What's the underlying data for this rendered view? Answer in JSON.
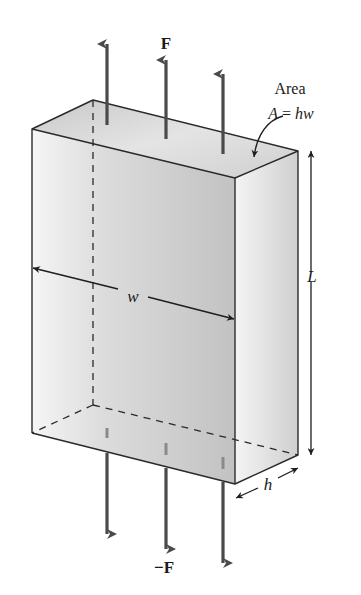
{
  "figure": {
    "labels": {
      "force_top": "F",
      "force_bottom": "−F",
      "area_title": "Area",
      "area_formula": "A = hw",
      "area_formula_parts": {
        "lhs": "A",
        "eq": " = ",
        "rhs": "hw"
      },
      "width": "w",
      "length": "L",
      "thickness": "h"
    },
    "colors": {
      "edge": "#2a2a2a",
      "arrow": "#4a4a4a",
      "front_face_light": "#f4f4f4",
      "front_face_dark": "#c4c4c4",
      "side_face_light": "#f2f2f2",
      "side_face_dark": "#d0d0d0",
      "top_face_light": "#ececec",
      "top_face_dark": "#c8c8c8",
      "background": "#ffffff"
    },
    "elements": {
      "top_force_arrows": 3,
      "bottom_force_arrows": 3,
      "dimension_arrows": [
        "w",
        "L",
        "h"
      ]
    }
  }
}
